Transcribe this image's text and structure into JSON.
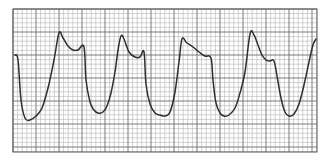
{
  "chart_data": {
    "type": "line",
    "title": "",
    "subtitle": "",
    "xlabel": "",
    "ylabel": "",
    "grid": true,
    "legend": null,
    "colors": {
      "background": "#ffffff",
      "minor_grid": "#b4b4b4",
      "major_grid": "#6e6e6e",
      "trace": "#2e2e2e"
    },
    "plot_area_px": {
      "x0": 13,
      "y0": 9,
      "x1": 317,
      "y1": 152
    },
    "grid_spacing_px": {
      "minor": 4.6,
      "major": 23
    },
    "units_note": "Values in pixel coordinates (y increases downward); no axis tick labels shown",
    "x": [
      15,
      18,
      21,
      25,
      30,
      36,
      42,
      48,
      54,
      59,
      63,
      68,
      73,
      78,
      84,
      86,
      90,
      94,
      98,
      103,
      107,
      111,
      115,
      118,
      121,
      124,
      129,
      135,
      140,
      144,
      146,
      150,
      155,
      160,
      165,
      170,
      175,
      179,
      182,
      187,
      193,
      199,
      205,
      211,
      213,
      216,
      220,
      224,
      229,
      235,
      240,
      245,
      250,
      254,
      258,
      262,
      266,
      270,
      274,
      277,
      281,
      285,
      289,
      294,
      299,
      304,
      309,
      313,
      316
    ],
    "y": [
      55,
      60,
      100,
      118,
      120,
      116,
      108,
      88,
      60,
      33,
      38,
      46,
      50,
      50,
      47,
      80,
      102,
      110,
      113,
      112,
      106,
      93,
      72,
      50,
      36,
      39,
      52,
      57,
      57,
      52,
      84,
      104,
      113,
      115,
      116,
      112,
      92,
      62,
      39,
      43,
      47,
      52,
      56,
      58,
      80,
      103,
      113,
      116,
      115,
      108,
      93,
      72,
      34,
      35,
      45,
      55,
      60,
      61,
      61,
      76,
      98,
      112,
      116,
      114,
      104,
      85,
      62,
      45,
      39
    ],
    "cycles": [
      {
        "trough": [
          25,
          120
        ],
        "peak": [
          59,
          33
        ],
        "notch": [
          84,
          47
        ]
      },
      {
        "trough": [
          98,
          113
        ],
        "peak": [
          121,
          36
        ],
        "notch": [
          144,
          52
        ]
      },
      {
        "trough": [
          165,
          116
        ],
        "peak": [
          182,
          39
        ],
        "notch": [
          211,
          58
        ]
      },
      {
        "trough": [
          224,
          116
        ],
        "peak": [
          250,
          34
        ],
        "notch": [
          274,
          61
        ]
      },
      {
        "trough": [
          289,
          116
        ],
        "peak": null,
        "notch": null
      }
    ]
  }
}
